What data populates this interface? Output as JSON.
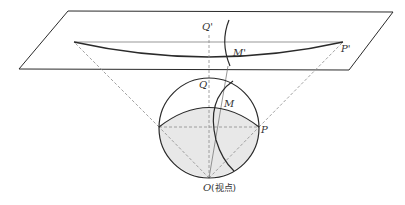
{
  "diagram": {
    "labels": {
      "q_prime": "Q'",
      "m_prime": "M'",
      "p_prime": "P'",
      "q": "Q",
      "m": "M",
      "p": "P",
      "o": "O",
      "o_note": "(视点)"
    },
    "colors": {
      "stroke": "#2a2a2a",
      "dashed": "#8a8a8a",
      "shade": "#e8e8e8",
      "text": "#333333"
    },
    "plane": {
      "corners": [
        [
          68,
          11
        ],
        [
          393,
          12
        ],
        [
          349,
          70
        ],
        [
          19,
          69
        ]
      ]
    },
    "sphere": {
      "center": [
        209,
        128
      ],
      "radius": 50
    },
    "points": {
      "Q_prime": [
        209,
        31
      ],
      "P_prime": [
        343,
        42
      ],
      "left_end": [
        74,
        42
      ],
      "Q": [
        209,
        77
      ],
      "M": [
        222,
        106
      ],
      "P": [
        259,
        127
      ],
      "left": [
        159,
        127
      ],
      "O": [
        209,
        178
      ]
    }
  }
}
